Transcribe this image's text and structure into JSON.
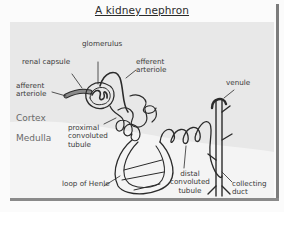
{
  "title": "A kidney nephron",
  "zones": {
    "cortex": "Cortex",
    "medulla": "Medulla"
  },
  "labels": {
    "glomerulus": "glomerulus",
    "renal_capsule": "renal capsule",
    "efferent_arteriole_1": "efferent",
    "efferent_arteriole_2": "arteriole",
    "afferent_arteriole_1": "afferent",
    "afferent_arteriole_2": "arteriole",
    "venule": "venule",
    "proximal_1": "proximal",
    "proximal_2": "convoluted",
    "proximal_3": "tubule",
    "loop_of_henle": "loop of Henle",
    "distal_1": "distal",
    "distal_2": "convoluted",
    "distal_3": "tubule",
    "collecting_1": "collecting",
    "collecting_2": "duct"
  },
  "colors": {
    "background": "#fbfbfb",
    "cortex_band": "#e6e6e6",
    "medulla_band": "#f3f3f3",
    "edge_shadow": "#7c7c7c",
    "line": "#2b2b2b",
    "vessel_fill": "#8a8a8a"
  }
}
